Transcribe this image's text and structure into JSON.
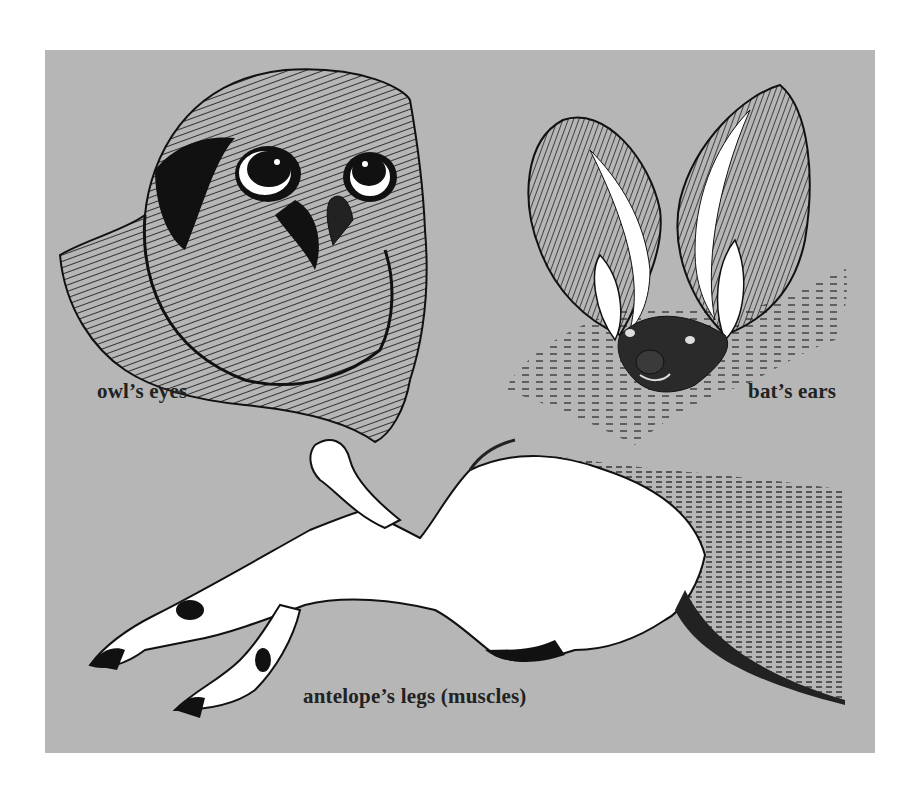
{
  "figure": {
    "background_color": "#b6b6b6",
    "ink_color": "#111111",
    "labels": {
      "owl": "owl’s eyes",
      "bat": "bat’s ears",
      "antelope": "antelope’s legs (muscles)"
    },
    "illustrations": [
      {
        "subject": "owl",
        "feature": "eyes"
      },
      {
        "subject": "bat",
        "feature": "ears"
      },
      {
        "subject": "antelope",
        "feature": "legs (muscles)"
      }
    ]
  }
}
